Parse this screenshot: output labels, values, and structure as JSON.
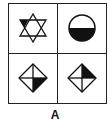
{
  "figure": {
    "caption": "A",
    "colors": {
      "stroke": "#111111",
      "fill": "#111111",
      "background": "#ffffff"
    },
    "cells": [
      {
        "position": "top-left",
        "shape": "hexagram",
        "shaded": "left point of upper triangle"
      },
      {
        "position": "top-right",
        "shape": "circle",
        "shaded": "bottom half"
      },
      {
        "position": "bottom-left",
        "shape": "diamond-with-cross",
        "shaded": "bottom-right quarter"
      },
      {
        "position": "bottom-right",
        "shape": "diamond-with-cross",
        "shaded": "top-right quarter"
      }
    ]
  }
}
